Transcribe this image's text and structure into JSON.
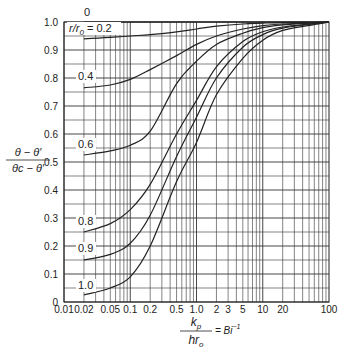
{
  "chart_data": {
    "type": "line",
    "title": "",
    "xlabel_num": "k_p",
    "xlabel_den": "hr_o",
    "xlabel_suffix": "= Bi^-1",
    "ylabel_num": "θ − θ′",
    "ylabel_den": "θc − θ′",
    "xscale": "log",
    "xlim": [
      0.01,
      100
    ],
    "ylim": [
      0,
      1.0
    ],
    "grid": true,
    "x_ticks": [
      {
        "v": 0.01,
        "label": "0.01"
      },
      {
        "v": 0.02,
        "label": "0.02"
      },
      {
        "v": 0.05,
        "label": "0.05"
      },
      {
        "v": 0.1,
        "label": "0.1"
      },
      {
        "v": 0.2,
        "label": "0.2"
      },
      {
        "v": 0.5,
        "label": "0.5"
      },
      {
        "v": 1,
        "label": "1.0"
      },
      {
        "v": 2,
        "label": "2"
      },
      {
        "v": 3,
        "label": "3"
      },
      {
        "v": 5,
        "label": "5"
      },
      {
        "v": 10,
        "label": "10"
      },
      {
        "v": 20,
        "label": "20"
      },
      {
        "v": 100,
        "label": "100"
      }
    ],
    "y_ticks": [
      {
        "v": 0,
        "label": "0"
      },
      {
        "v": 0.1,
        "label": "0.1"
      },
      {
        "v": 0.2,
        "label": "0.2"
      },
      {
        "v": 0.3,
        "label": "0.3"
      },
      {
        "v": 0.4,
        "label": "0.4"
      },
      {
        "v": 0.5,
        "label": "0.5"
      },
      {
        "v": 0.6,
        "label": "0.6"
      },
      {
        "v": 0.7,
        "label": "0.7"
      },
      {
        "v": 0.8,
        "label": "0.8"
      },
      {
        "v": 0.9,
        "label": "0.9"
      },
      {
        "v": 1.0,
        "label": "1.0"
      }
    ],
    "x": [
      0.02,
      0.05,
      0.1,
      0.2,
      0.5,
      1,
      2,
      5,
      10,
      20,
      50,
      100
    ],
    "series": [
      {
        "name": "0",
        "label": "0",
        "values": [
          1.0,
          1.0,
          1.0,
          1.0,
          1.0,
          1.0,
          1.0,
          1.0,
          1.0,
          1.0,
          1.0,
          1.0
        ]
      },
      {
        "name": "r/r0 = 0.2",
        "label": "r/r0 = 0.2",
        "values": [
          0.94,
          0.945,
          0.95,
          0.955,
          0.965,
          0.975,
          0.985,
          0.993,
          0.996,
          0.998,
          0.999,
          1.0
        ]
      },
      {
        "name": "0.4",
        "label": "0.4",
        "values": [
          0.765,
          0.775,
          0.795,
          0.83,
          0.88,
          0.92,
          0.95,
          0.975,
          0.987,
          0.993,
          0.997,
          1.0
        ]
      },
      {
        "name": "0.6",
        "label": "0.6",
        "values": [
          0.525,
          0.54,
          0.56,
          0.61,
          0.78,
          0.86,
          0.92,
          0.96,
          0.98,
          0.99,
          0.996,
          1.0
        ]
      },
      {
        "name": "0.8",
        "label": "0.8",
        "values": [
          0.25,
          0.28,
          0.33,
          0.42,
          0.6,
          0.72,
          0.84,
          0.93,
          0.965,
          0.982,
          0.993,
          1.0
        ]
      },
      {
        "name": "0.9",
        "label": "0.9",
        "values": [
          0.15,
          0.17,
          0.21,
          0.31,
          0.52,
          0.66,
          0.8,
          0.91,
          0.955,
          0.978,
          0.991,
          1.0
        ]
      },
      {
        "name": "1.0",
        "label": "1.0",
        "values": [
          0.025,
          0.05,
          0.09,
          0.2,
          0.43,
          0.57,
          0.74,
          0.87,
          0.935,
          0.97,
          0.988,
          1.0
        ]
      }
    ]
  }
}
